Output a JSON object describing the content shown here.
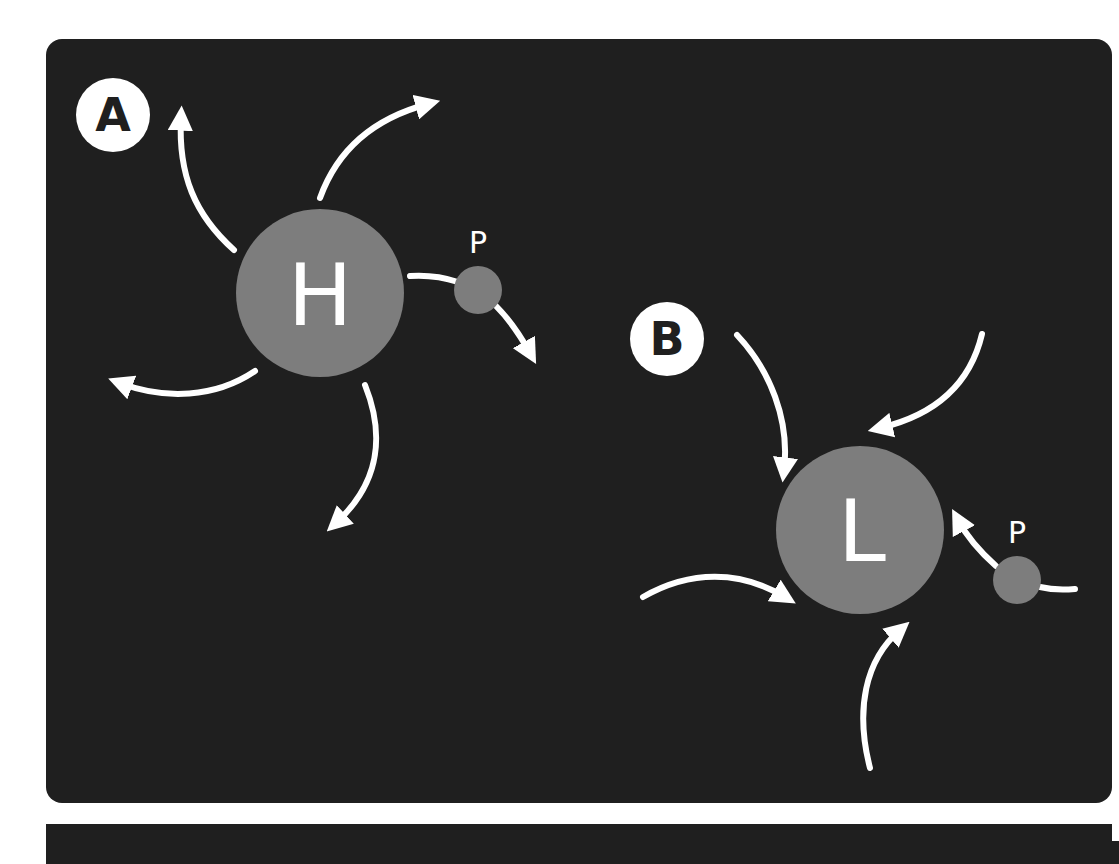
{
  "diagram": {
    "colors": {
      "background": "#1f1f1f",
      "page": "#ffffff",
      "node_fill": "#7d7d7d",
      "arrow": "#ffffff",
      "badge_fill": "#ffffff",
      "badge_text": "#1f1f1f",
      "node_text": "#ffffff"
    },
    "panels": [
      {
        "label": "A",
        "center_node": {
          "label": "H",
          "meaning": "high pressure",
          "cx": 320,
          "cy": 293,
          "r": 84
        },
        "particle": {
          "label": "P",
          "cx": 478,
          "cy": 290,
          "r": 24
        },
        "flow": "outward",
        "arrow_count": 5
      },
      {
        "label": "B",
        "center_node": {
          "label": "L",
          "meaning": "low pressure",
          "cx": 860,
          "cy": 530,
          "r": 84
        },
        "particle": {
          "label": "P",
          "cx": 1017,
          "cy": 580,
          "r": 24
        },
        "flow": "inward",
        "arrow_count": 5
      }
    ]
  }
}
